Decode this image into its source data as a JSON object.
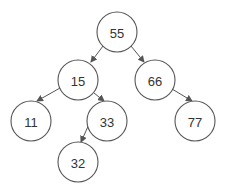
{
  "diagram": {
    "type": "binary-tree",
    "nodes": [
      {
        "id": "n55",
        "label": "55",
        "cx": 117,
        "cy": 32
      },
      {
        "id": "n15",
        "label": "15",
        "cx": 78,
        "cy": 80
      },
      {
        "id": "n66",
        "label": "66",
        "cx": 155,
        "cy": 80
      },
      {
        "id": "n11",
        "label": "11",
        "cx": 31,
        "cy": 121
      },
      {
        "id": "n33",
        "label": "33",
        "cx": 107,
        "cy": 121
      },
      {
        "id": "n77",
        "label": "77",
        "cx": 195,
        "cy": 121
      },
      {
        "id": "n32",
        "label": "32",
        "cx": 78,
        "cy": 162
      }
    ],
    "edges": [
      {
        "from": "55",
        "to": "15"
      },
      {
        "from": "55",
        "to": "66"
      },
      {
        "from": "15",
        "to": "11"
      },
      {
        "from": "15",
        "to": "33"
      },
      {
        "from": "66",
        "to": "77"
      },
      {
        "from": "33",
        "to": "32"
      }
    ],
    "colors": {
      "stroke": "#555555",
      "text": "#333333",
      "fill": "#ffffff"
    }
  }
}
